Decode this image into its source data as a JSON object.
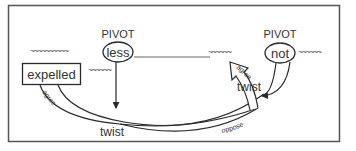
{
  "diagram": {
    "pivots": [
      {
        "label": "PIVOT",
        "word": "less"
      },
      {
        "label": "PIVOT",
        "word": "not"
      }
    ],
    "box_word": "expelled",
    "context_tilde_left": "~~~~~~~~~~",
    "context_tilde_mid": "~~~~~~",
    "context_tilde_right1": "~~~~~~",
    "context_tilde_right2": "~~~~~~",
    "context_tilde_under_less": "~~~~~~",
    "edges": {
      "twist_bottom": "twist",
      "twist_right": "twist",
      "agree_left": "agree",
      "agree_right": "agree",
      "oppose": "oppose"
    },
    "colors": {
      "stroke": "#2a2a2a",
      "frame": "#555555",
      "background": "#ffffff"
    }
  }
}
